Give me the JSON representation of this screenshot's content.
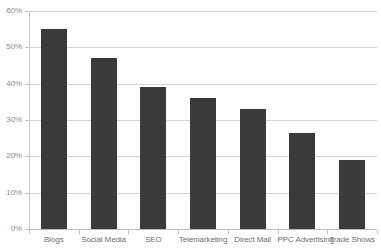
{
  "chart_data": {
    "type": "bar",
    "title": "",
    "title_note": "cropped off top of image, illegible",
    "xlabel": "",
    "ylabel": "",
    "categories": [
      "Blogs",
      "Social Media",
      "SEO",
      "Telemarketing",
      "Direct Mail",
      "PPC Advertising",
      "Trade Shows"
    ],
    "values": [
      55,
      47,
      39,
      36,
      33,
      26.5,
      19
    ],
    "value_unit": "%",
    "ylim": [
      0,
      60
    ],
    "ytick_labels": [
      "60%",
      "50%",
      "40%",
      "30%",
      "20%",
      "10%",
      "0%"
    ],
    "ytick_values": [
      60,
      50,
      40,
      30,
      20,
      10,
      0
    ],
    "grid": "horizontal",
    "legend": "none",
    "series": [
      {
        "name": "Percentage",
        "values": [
          55,
          47,
          39,
          36,
          33,
          26.5,
          19
        ]
      }
    ]
  },
  "style": {
    "bar_color": "#3a3a3a",
    "gridline_color": "#d3d3d3",
    "axis_color": "#c0c0c0",
    "tick_label_color": "#8a8a8a",
    "category_label_color": "#6e6e6e",
    "background": "#ffffff"
  },
  "title_remnant": {
    "text": ""
  }
}
